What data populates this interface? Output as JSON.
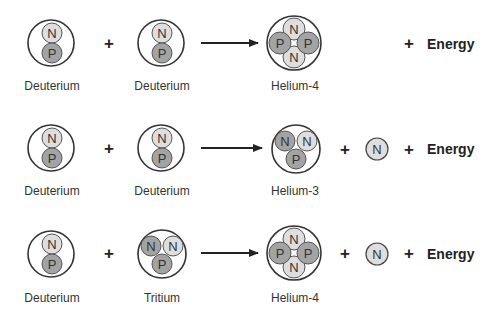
{
  "colors": {
    "proton_fill": "#a3a3a3",
    "neutron_fill": "#dedede",
    "neutron_dark_fill": "#a3a3a3",
    "outline": "#333333",
    "text": "#333333"
  },
  "symbols": {
    "neutron": "N",
    "proton": "P",
    "plus": "+",
    "energy": "Energy"
  },
  "reactions": [
    {
      "reactant_1": "Deuterium",
      "reactant_2": "Deuterium",
      "product": "Helium-4",
      "free_neutron": false,
      "energy_label": "Energy"
    },
    {
      "reactant_1": "Deuterium",
      "reactant_2": "Deuterium",
      "product": "Helium-3",
      "free_neutron": true,
      "energy_label": "Energy"
    },
    {
      "reactant_1": "Deuterium",
      "reactant_2": "Tritium",
      "product": "Helium-4",
      "free_neutron": true,
      "energy_label": "Energy"
    }
  ]
}
